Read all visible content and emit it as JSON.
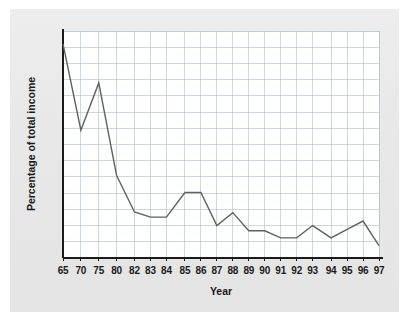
{
  "chart_data": {
    "type": "line",
    "title": "",
    "xlabel": "Year",
    "ylabel": "Percentage of total income",
    "categories": [
      "65",
      "70",
      "75",
      "80",
      "82",
      "83",
      "84",
      "85",
      "86",
      "87",
      "88",
      "89",
      "90",
      "91",
      "92",
      "93",
      "94",
      "95",
      "96",
      "97"
    ],
    "values": [
      3.3,
      1.97,
      2.7,
      1.27,
      0.71,
      0.63,
      0.63,
      1.01,
      1.01,
      0.5,
      0.7,
      0.42,
      0.42,
      0.31,
      0.31,
      0.5,
      0.31,
      0.44,
      0.57,
      0.19
    ],
    "series": [
      {
        "name": "Percentage of total income",
        "values": [
          3.3,
          1.97,
          2.7,
          1.27,
          0.71,
          0.63,
          0.63,
          1.01,
          1.01,
          0.5,
          0.7,
          0.42,
          0.42,
          0.31,
          0.31,
          0.5,
          0.31,
          0.44,
          0.57,
          0.19
        ]
      }
    ],
    "ylim": [
      0,
      3.5
    ],
    "ytick_labels": [
      "3.50",
      "3.25",
      "3.00",
      "2.75",
      "2.50",
      "2.25",
      "2.00",
      "1.75",
      "1.50",
      "1.25",
      "1.00",
      "0.75",
      "0.50",
      "0.25",
      "0"
    ],
    "ytick_values": [
      3.5,
      3.25,
      3.0,
      2.75,
      2.5,
      2.25,
      2.0,
      1.75,
      1.5,
      1.25,
      1.0,
      0.75,
      0.5,
      0.25,
      0
    ],
    "grid": true,
    "legend": false,
    "legend_position": "none",
    "colors": {
      "line": "#5f6063",
      "grid": "#b9c4d4",
      "axis": "#1a1a1a",
      "plot_background": "#ffffff",
      "figure_background": "#e9e9e9"
    }
  }
}
